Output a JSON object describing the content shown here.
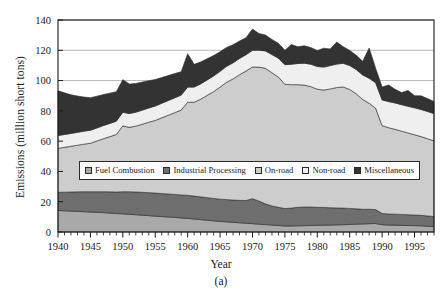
{
  "figure": {
    "caption": "(a)"
  },
  "axes": {
    "ylabel": "Emissions (million short tons)",
    "xlabel": "Year",
    "y_ticks": [
      "0",
      "20",
      "40",
      "60",
      "80",
      "100",
      "120",
      "140"
    ],
    "x_ticks": [
      "1940",
      "1945",
      "1950",
      "1955",
      "1960",
      "1965",
      "1970",
      "1975",
      "1980",
      "1985",
      "1990",
      "1995"
    ]
  },
  "legend": {
    "entries": [
      {
        "label": "Fuel Combustion",
        "color": "#a9a9a9"
      },
      {
        "label": "Industrial Processing",
        "color": "#6e6e6e"
      },
      {
        "label": "On-road",
        "color": "#cdcdcd"
      },
      {
        "label": "Non-road",
        "color": "#efefef"
      },
      {
        "label": "Miscellaneous",
        "color": "#333333"
      }
    ]
  },
  "chart_data": {
    "type": "area",
    "title": "",
    "xlabel": "Year",
    "ylabel": "Emissions (million short tons)",
    "xlim": [
      1940,
      1998
    ],
    "ylim": [
      0,
      140
    ],
    "grid": "horizontal",
    "legend_position": "inside-center",
    "stacked": true,
    "x": [
      1940,
      1941,
      1942,
      1943,
      1944,
      1945,
      1946,
      1947,
      1948,
      1949,
      1950,
      1951,
      1952,
      1953,
      1954,
      1955,
      1956,
      1957,
      1958,
      1959,
      1960,
      1961,
      1962,
      1963,
      1964,
      1965,
      1966,
      1967,
      1968,
      1969,
      1970,
      1971,
      1972,
      1973,
      1974,
      1975,
      1976,
      1977,
      1978,
      1979,
      1980,
      1981,
      1982,
      1983,
      1984,
      1985,
      1986,
      1987,
      1988,
      1989,
      1990,
      1991,
      1992,
      1993,
      1994,
      1995,
      1996,
      1997,
      1998
    ],
    "series": [
      {
        "name": "Fuel Combustion",
        "color": "#a9a9a9",
        "values": [
          14.2,
          14.0,
          13.8,
          13.6,
          13.4,
          13.2,
          13.0,
          12.8,
          12.5,
          12.2,
          12.0,
          11.7,
          11.4,
          11.1,
          10.8,
          10.5,
          10.2,
          9.9,
          9.6,
          9.3,
          9.0,
          8.6,
          8.2,
          7.8,
          7.4,
          7.0,
          6.7,
          6.4,
          6.1,
          5.8,
          5.5,
          5.2,
          4.9,
          4.6,
          4.3,
          4.0,
          4.0,
          4.1,
          4.2,
          4.3,
          4.4,
          4.5,
          4.6,
          4.7,
          4.8,
          5.0,
          5.2,
          5.3,
          5.5,
          5.6,
          4.8,
          4.6,
          4.5,
          4.4,
          4.3,
          4.2,
          4.1,
          3.8,
          3.5
        ]
      },
      {
        "name": "Industrial Processing",
        "color": "#6e6e6e",
        "values": [
          12.0,
          12.3,
          12.6,
          12.9,
          13.2,
          13.4,
          13.6,
          13.8,
          14.0,
          14.2,
          14.6,
          14.9,
          15.0,
          15.1,
          15.2,
          15.2,
          15.2,
          15.2,
          15.2,
          15.2,
          15.2,
          15.1,
          15.0,
          14.9,
          14.8,
          14.7,
          14.7,
          14.7,
          14.8,
          15.0,
          16.5,
          15.2,
          13.7,
          12.6,
          12.0,
          11.5,
          11.8,
          12.2,
          12.3,
          12.2,
          11.9,
          11.7,
          11.4,
          11.2,
          11.0,
          10.6,
          10.1,
          9.7,
          9.5,
          9.2,
          7.4,
          7.3,
          7.3,
          7.2,
          7.1,
          7.0,
          6.9,
          6.8,
          6.7
        ]
      },
      {
        "name": "On-road",
        "color": "#cdcdcd",
        "values": [
          29.0,
          29.6,
          30.2,
          30.8,
          31.4,
          32.0,
          33.5,
          35.0,
          36.5,
          38.0,
          43.5,
          42.5,
          43.5,
          45.0,
          46.5,
          48.0,
          50.0,
          52.0,
          54.0,
          56.0,
          61.5,
          62.0,
          64.5,
          67.5,
          70.5,
          74.0,
          77.5,
          80.0,
          83.0,
          85.5,
          87.0,
          88.5,
          89.5,
          88.0,
          86.0,
          82.0,
          81.5,
          81.0,
          80.5,
          79.5,
          78.0,
          77.5,
          78.5,
          79.5,
          80.0,
          78.5,
          76.0,
          72.5,
          70.0,
          67.0,
          58.0,
          57.0,
          56.0,
          55.0,
          54.0,
          53.0,
          52.0,
          51.0,
          50.0
        ]
      },
      {
        "name": "Non-road",
        "color": "#efefef",
        "values": [
          8.5,
          8.5,
          8.5,
          8.5,
          8.6,
          8.6,
          8.6,
          8.7,
          8.7,
          8.8,
          9.0,
          9.1,
          9.2,
          9.3,
          9.4,
          9.5,
          9.6,
          9.7,
          9.8,
          9.9,
          10.0,
          10.0,
          10.1,
          10.2,
          10.3,
          10.4,
          10.5,
          10.6,
          10.7,
          10.8,
          11.0,
          11.2,
          11.5,
          12.0,
          12.5,
          13.0,
          13.5,
          14.0,
          14.5,
          14.8,
          15.0,
          15.2,
          15.4,
          15.5,
          15.6,
          15.8,
          16.0,
          16.2,
          16.5,
          16.8,
          17.0,
          17.2,
          17.4,
          17.5,
          17.6,
          17.8,
          17.9,
          18.0,
          18.0
        ]
      },
      {
        "name": "Miscellaneous",
        "color": "#333333",
        "values": [
          29.5,
          27.5,
          25.5,
          24.0,
          22.5,
          21.5,
          21.0,
          20.5,
          20.0,
          19.5,
          21.5,
          19.5,
          19.0,
          18.5,
          18.0,
          17.5,
          17.0,
          16.5,
          16.0,
          15.5,
          22.0,
          15.0,
          14.5,
          14.0,
          13.5,
          13.0,
          12.5,
          12.0,
          11.5,
          11.2,
          14.0,
          11.0,
          10.5,
          10.0,
          9.8,
          9.5,
          13.0,
          11.0,
          11.5,
          11.0,
          10.5,
          12.5,
          11.0,
          14.5,
          11.0,
          10.0,
          9.5,
          9.0,
          20.0,
          9.5,
          8.5,
          11.0,
          9.0,
          8.0,
          10.5,
          8.0,
          9.0,
          8.5,
          8.0
        ]
      }
    ]
  }
}
